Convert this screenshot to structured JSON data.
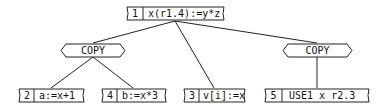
{
  "diagram": {
    "type": "tree",
    "nodes": [
      {
        "id": "root",
        "index": "1",
        "label": "x(r1.4):=y*z"
      },
      {
        "id": "copy-left",
        "label": "COPY"
      },
      {
        "id": "copy-right",
        "label": "COPY"
      },
      {
        "id": "n2",
        "index": "2",
        "label": "a:=x+1"
      },
      {
        "id": "n4",
        "index": "4",
        "label": "b:=x*3"
      },
      {
        "id": "n3",
        "index": "3",
        "label": "v[i]:=x"
      },
      {
        "id": "n5",
        "index": "5",
        "label": "USE1 x r2.3"
      }
    ],
    "edges": [
      [
        "root",
        "copy-left"
      ],
      [
        "root",
        "n3"
      ],
      [
        "root",
        "copy-right"
      ],
      [
        "copy-left",
        "n2"
      ],
      [
        "copy-left",
        "n4"
      ],
      [
        "copy-right",
        "n5"
      ]
    ]
  }
}
